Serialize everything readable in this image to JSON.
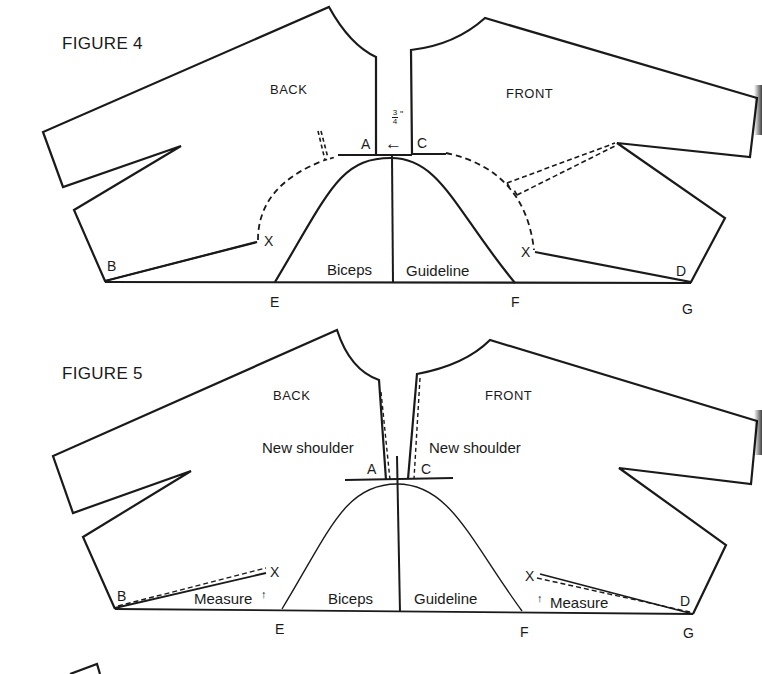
{
  "figure4": {
    "title": "FIGURE 4",
    "back_label": "BACK",
    "front_label": "FRONT",
    "measurement": "3/4\"",
    "measurement_num": "3",
    "measurement_den": "4",
    "measurement_unit": "\"",
    "arrow": "←",
    "points": {
      "A": "A",
      "C": "C",
      "B": "B",
      "D": "D",
      "E": "E",
      "F": "F",
      "G": "G",
      "X_back": "X",
      "X_front": "X"
    },
    "biceps_label": "Biceps",
    "guideline_label": "Guideline"
  },
  "figure5": {
    "title": "FIGURE 5",
    "back_label": "BACK",
    "front_label": "FRONT",
    "new_shoulder_left": "New shoulder",
    "new_shoulder_right": "New shoulder",
    "points": {
      "A": "A",
      "C": "C",
      "B": "B",
      "D": "D",
      "E": "E",
      "F": "F",
      "G": "G",
      "X_back": "X",
      "X_front": "X"
    },
    "biceps_label": "Biceps",
    "guideline_label": "Guideline",
    "measure_left": "Measure",
    "measure_right": "Measure",
    "up_arrow": "↑"
  },
  "colors": {
    "ink": "#1a1a1a",
    "paper": "#ffffff"
  }
}
